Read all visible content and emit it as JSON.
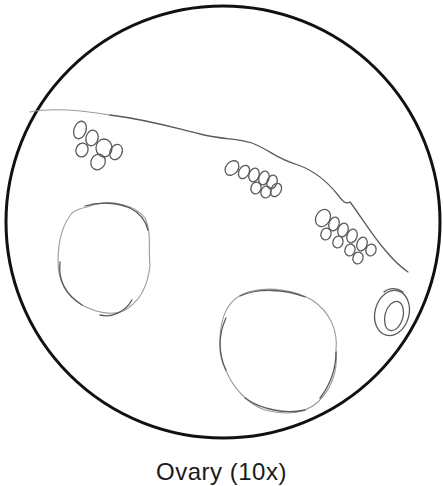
{
  "figure": {
    "type": "microscope field-of-view sketch",
    "caption": "Ovary (10x)",
    "magnification": "10x",
    "colors": {
      "field_outline": "#111111",
      "pencil_stroke": "#5a5a5a",
      "light_stroke": "#9a9a9a",
      "background": "#ffffff"
    },
    "structures": [
      {
        "name": "field-of-view-circle",
        "description": "circular microscope field boundary"
      },
      {
        "name": "germinal-epithelium-edge",
        "description": "wavy tissue surface line across upper field"
      },
      {
        "name": "primordial-follicle-cluster-left",
        "count": 6
      },
      {
        "name": "primordial-follicle-cluster-middle",
        "count": 8
      },
      {
        "name": "primordial-follicle-cluster-right",
        "count": 10
      },
      {
        "name": "large-follicle-left",
        "description": "large round follicle, left-middle"
      },
      {
        "name": "large-follicle-bottom",
        "description": "large round follicle, bottom-center"
      },
      {
        "name": "small-follicle-with-oocyte",
        "description": "small oval follicle with inner oocyte, right"
      }
    ]
  }
}
